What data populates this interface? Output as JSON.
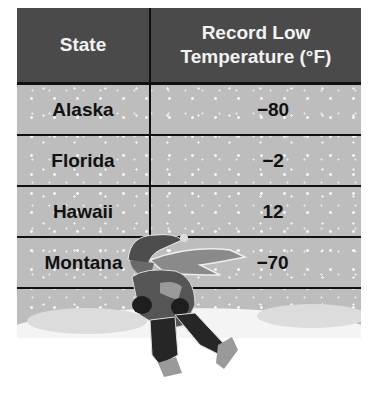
{
  "table": {
    "headers": [
      "State",
      "Record Low Temperature (°F)"
    ],
    "header_lines": {
      "state": "State",
      "temp_line1": "Record Low",
      "temp_line2": "Temperature (°F)"
    },
    "rows": [
      {
        "state": "Alaska",
        "temp": "−80"
      },
      {
        "state": "Florida",
        "temp": "−2"
      },
      {
        "state": "Hawaii",
        "temp": "12"
      },
      {
        "state": "Montana",
        "temp": "−70"
      }
    ]
  },
  "illustration": {
    "description": "Person in hat and scarf walking through snowstorm"
  },
  "colors": {
    "header_bg": "#4a4a4a",
    "header_text": "#f2f2f2",
    "body_bg": "#bdbdbd",
    "rule": "#111111",
    "snow_ground": "#f4f4f4"
  }
}
